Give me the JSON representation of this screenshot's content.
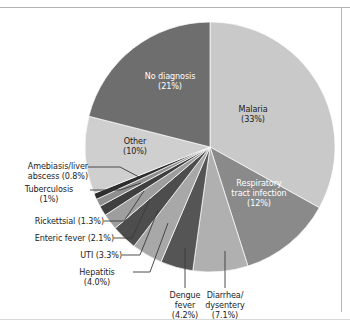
{
  "chart_data": {
    "type": "pie",
    "title": "",
    "subtitle": "",
    "xlabel": "",
    "ylabel": "",
    "legend_position": "none",
    "grid": false,
    "units": "percent",
    "start_angle_deg": 0,
    "direction": "clockwise",
    "categories": [
      "Malaria",
      "Respiratory tract infection",
      "Diarrhea/dysentery",
      "Dengue fever",
      "Hepatitis",
      "UTI",
      "Enteric fever",
      "Rickettsial",
      "Tuberculosis",
      "Amebiasis/liver abscess",
      "Other",
      "No diagnosis"
    ],
    "values": [
      33,
      12,
      7.1,
      4.2,
      4.0,
      3.3,
      2.1,
      1.3,
      1,
      0.8,
      10,
      21
    ],
    "value_labels": [
      "(33%)",
      "(12%)",
      "(7.1%)",
      "(4.2%)",
      "(4.0%)",
      "(3.3%)",
      "(2.1%)",
      "(1.3%)",
      "(1%)",
      "(0.8%)",
      "(10%)",
      "(21%)"
    ],
    "colors": [
      "#c9c9c9",
      "#8a8a8a",
      "#b0b0b0",
      "#555555",
      "#a8a8a8",
      "#4d4d4d",
      "#9e9e9e",
      "#3f3f3f",
      "#8f8f8f",
      "#2e2e2e",
      "#cfcfcf",
      "#6e6e6e"
    ]
  },
  "labels": {
    "malaria": {
      "name": "Malaria",
      "pct": "(33%)"
    },
    "respiratory": {
      "name1": "Respiratory",
      "name2": "tract infection",
      "pct": "(12%)"
    },
    "diarrhea": {
      "name1": "Diarrhea/",
      "name2": "dysentery",
      "pct": "(7.1%)"
    },
    "dengue": {
      "name1": "Dengue",
      "name2": "fever",
      "pct": "(4.2%)"
    },
    "hepatitis": {
      "name": "Hepatitis",
      "pct": "(4.0%)"
    },
    "uti": {
      "text": "UTI (3.3%)"
    },
    "enteric": {
      "text": "Enteric fever (2.1%)"
    },
    "rickettsial": {
      "text": "Rickettsial (1.3%)"
    },
    "tuberculosis": {
      "name": "Tuberculosis",
      "pct": "(1%)"
    },
    "amebiasis": {
      "name1": "Amebiasis/liver",
      "name2": "abscess (0.8%)"
    },
    "other": {
      "name": "Other",
      "pct": "(10%)"
    },
    "nodiagnosis": {
      "name": "No diagnosis",
      "pct": "(21%)"
    }
  }
}
